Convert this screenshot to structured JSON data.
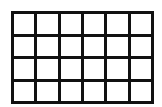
{
  "grid": {
    "columns": 6,
    "rows": 4,
    "line_color": "#111111",
    "cell_color": "#ffffff"
  }
}
